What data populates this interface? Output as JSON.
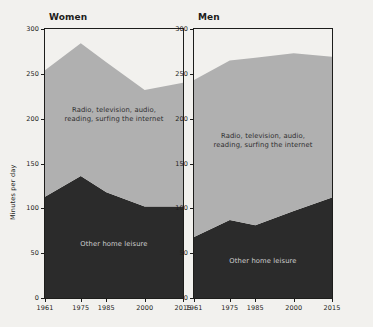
{
  "chart_data": {
    "type": "area",
    "title": "",
    "xlabel": "",
    "ylabel": "Minutes per day",
    "x": [
      1961,
      1975,
      1985,
      2000,
      2015
    ],
    "xtick_labels": [
      "1961",
      "1975",
      "1985",
      "2000",
      "2015"
    ],
    "ytick_labels": [
      "0",
      "50",
      "100",
      "150",
      "200",
      "250",
      "300"
    ],
    "ytick_values": [
      0,
      50,
      100,
      150,
      200,
      250,
      300
    ],
    "ylim": [
      0,
      300
    ],
    "grid": false,
    "legend_position": "inside-plot-annotations",
    "stacked": true,
    "panels": [
      {
        "name": "Women",
        "title": "Women",
        "series": [
          {
            "name": "Other home leisure",
            "label": "Other home leisure",
            "color": "#2b2b2b",
            "label_color": "#cfcfcf",
            "values": [
              113,
              136,
              118,
              102,
              102
            ]
          },
          {
            "name": "Radio, television, audio, reading, surfing the internet",
            "label_line1": "Radio, television, audio,",
            "label_line2": "reading, surfing the internet",
            "color": "#b0b0b0",
            "label_color": "#2e2e2e",
            "values": [
              141,
              148,
              145,
              130,
              138
            ]
          }
        ],
        "totals": [
          254,
          284,
          263,
          232,
          240
        ]
      },
      {
        "name": "Men",
        "title": "Men",
        "series": [
          {
            "name": "Other home leisure",
            "label": "Other home leisure",
            "color": "#2b2b2b",
            "label_color": "#cfcfcf",
            "values": [
              68,
              87,
              81,
              97,
              112
            ]
          },
          {
            "name": "Radio, television, audio, reading, surfing the internet",
            "label_line1": "Radio, television, audio,",
            "label_line2": "reading, surfing the internet",
            "color": "#b0b0b0",
            "label_color": "#2e2e2e",
            "values": [
              175,
              178,
              187,
              176,
              157
            ]
          }
        ],
        "totals": [
          243,
          265,
          268,
          273,
          269
        ]
      }
    ],
    "colors": {
      "background": "#f2f1ee",
      "axis": "#1d1d1b",
      "band_lower": "#2b2b2b",
      "band_upper": "#b0b0b0"
    }
  }
}
